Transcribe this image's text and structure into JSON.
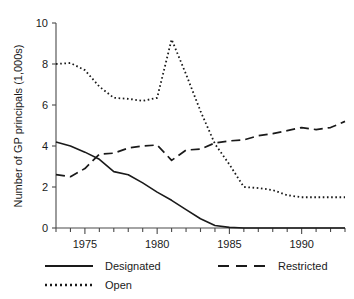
{
  "chart_data": {
    "type": "line",
    "title": "",
    "xlabel": "",
    "ylabel": "Number of GP principals (1,000s)",
    "xlim": [
      1973,
      1993
    ],
    "ylim": [
      0,
      10
    ],
    "grid": false,
    "legend_position": "bottom",
    "x": [
      1973,
      1974,
      1975,
      1976,
      1977,
      1978,
      1979,
      1980,
      1981,
      1982,
      1983,
      1984,
      1985,
      1986,
      1987,
      1988,
      1989,
      1990,
      1991,
      1992,
      1993
    ],
    "xticks": [
      1975,
      1980,
      1985,
      1990
    ],
    "xtick_labels": [
      "1975",
      "1980",
      "1985",
      "1990"
    ],
    "xtick_minor_step": 1,
    "yticks": [
      0,
      2,
      4,
      6,
      8,
      10
    ],
    "ytick_labels": [
      "0",
      "2",
      "4",
      "6",
      "8",
      "10"
    ],
    "series": [
      {
        "name": "Designated",
        "style": "solid",
        "color": "#1a1a1a",
        "values": [
          4.2,
          4.0,
          3.7,
          3.35,
          2.75,
          2.6,
          2.2,
          1.75,
          1.35,
          0.9,
          0.45,
          0.12,
          0.03,
          0.0,
          0.0,
          0.0,
          0.0,
          0.0,
          0.0,
          0.0,
          0.0
        ]
      },
      {
        "name": "Open",
        "style": "dotted",
        "color": "#1a1a1a",
        "values": [
          8.0,
          8.05,
          7.7,
          6.9,
          6.35,
          6.3,
          6.2,
          6.35,
          9.2,
          7.5,
          5.7,
          4.1,
          3.1,
          2.0,
          1.95,
          1.85,
          1.6,
          1.5,
          1.5,
          1.5,
          1.5
        ]
      },
      {
        "name": "Restricted",
        "style": "dashed",
        "color": "#1a1a1a",
        "values": [
          2.6,
          2.5,
          2.9,
          3.6,
          3.65,
          3.9,
          4.0,
          4.05,
          3.3,
          3.8,
          3.85,
          4.15,
          4.25,
          4.3,
          4.5,
          4.6,
          4.75,
          4.9,
          4.8,
          4.9,
          5.2
        ]
      }
    ],
    "legend_entries": [
      {
        "label": "Designated",
        "style": "solid"
      },
      {
        "label": "Restricted",
        "style": "dashed"
      },
      {
        "label": "Open",
        "style": "dotted"
      }
    ]
  }
}
